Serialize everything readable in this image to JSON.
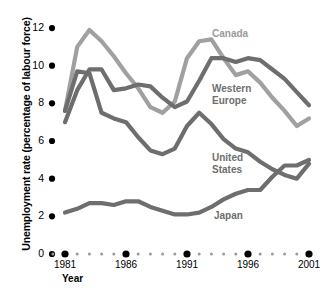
{
  "chart_data": {
    "type": "line",
    "title": "",
    "xlabel": "Year",
    "ylabel": "Unemployment rate (percentage of labour force)",
    "xlim": [
      1980,
      2001
    ],
    "ylim": [
      0,
      12
    ],
    "grid": false,
    "legend_position": "inline-right",
    "y_ticks": [
      0,
      2,
      4,
      6,
      8,
      10,
      12
    ],
    "y_tick_labels": [
      "0",
      "2",
      "4",
      "6",
      "8",
      "10",
      "12"
    ],
    "x_major_ticks": [
      1981,
      1986,
      1991,
      1996,
      2001
    ],
    "x_major_tick_labels": [
      "1981",
      "1986",
      "1991",
      "1996",
      "2001"
    ],
    "x_minor_ticks": [
      1980,
      1982,
      1983,
      1984,
      1985,
      1987,
      1988,
      1989,
      1990,
      1992,
      1993,
      1994,
      1995,
      1997,
      1998,
      1999,
      2000
    ],
    "x": [
      1981,
      1982,
      1983,
      1984,
      1985,
      1986,
      1987,
      1988,
      1989,
      1990,
      1991,
      1992,
      1993,
      1994,
      1995,
      1996,
      1997,
      1998,
      1999,
      2000,
      2001
    ],
    "series": [
      {
        "name": "Canada",
        "color": "#a0a0a0",
        "label_x": 212,
        "label_y": 28,
        "values": [
          7.6,
          11.0,
          11.9,
          11.3,
          10.5,
          9.6,
          8.8,
          7.8,
          7.5,
          8.1,
          10.4,
          11.3,
          11.4,
          10.4,
          9.5,
          9.7,
          9.1,
          8.3,
          7.6,
          6.8,
          7.2
        ]
      },
      {
        "name": "Western Europe",
        "color": "#6e6e6e",
        "label_x": 212,
        "label_y": 83,
        "values": [
          7.0,
          8.7,
          9.8,
          9.8,
          8.7,
          8.8,
          9.0,
          8.9,
          8.3,
          7.8,
          8.1,
          9.2,
          10.4,
          10.4,
          10.2,
          10.4,
          10.3,
          9.8,
          9.3,
          8.6,
          7.9
        ]
      },
      {
        "name": "United States",
        "color": "#6e6e6e",
        "label_x": 212,
        "label_y": 152,
        "values": [
          7.6,
          9.7,
          9.6,
          7.5,
          7.2,
          7.0,
          6.2,
          5.5,
          5.3,
          5.6,
          6.8,
          7.5,
          6.9,
          6.1,
          5.6,
          5.4,
          4.9,
          4.5,
          4.2,
          4.0,
          4.8
        ]
      },
      {
        "name": "Japan",
        "color": "#6e6e6e",
        "label_x": 214,
        "label_y": 210,
        "values": [
          2.2,
          2.4,
          2.7,
          2.7,
          2.6,
          2.8,
          2.8,
          2.5,
          2.3,
          2.1,
          2.1,
          2.2,
          2.5,
          2.9,
          3.2,
          3.4,
          3.4,
          4.1,
          4.7,
          4.7,
          5.0
        ]
      }
    ]
  }
}
